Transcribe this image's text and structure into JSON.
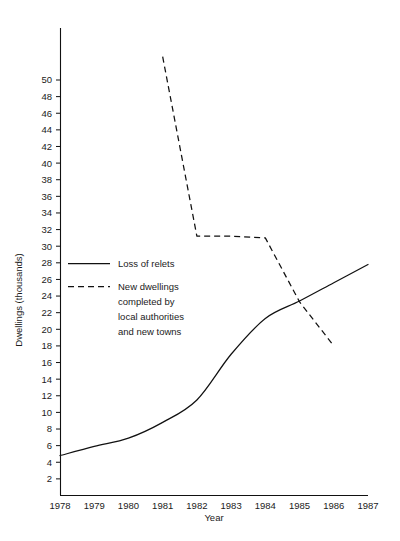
{
  "chart_data": {
    "type": "line",
    "title": "",
    "xlabel": "Year",
    "ylabel": "Dwellings (thousands)",
    "xlim": [
      1978,
      1987
    ],
    "ylim": [
      0,
      52
    ],
    "grid": false,
    "legend_position": "inside-left",
    "x": [
      1978,
      1979,
      1980,
      1981,
      1982,
      1983,
      1984,
      1985,
      1986,
      1987
    ],
    "xticklabels": [
      "1978",
      "1979",
      "1980",
      "1981",
      "1982",
      "1983",
      "1984",
      "1985",
      "1986",
      "1987"
    ],
    "yticks": [
      2,
      4,
      6,
      8,
      10,
      12,
      14,
      16,
      18,
      20,
      22,
      24,
      26,
      28,
      30,
      32,
      34,
      36,
      38,
      40,
      42,
      44,
      46,
      48,
      50
    ],
    "yticklabels": [
      "2",
      "4",
      "6",
      "8",
      "10",
      "12",
      "14",
      "16",
      "18",
      "20",
      "22",
      "24",
      "26",
      "28",
      "30",
      "32",
      "34",
      "36",
      "38",
      "40",
      "42",
      "44",
      "46",
      "48",
      "50"
    ],
    "series": [
      {
        "name": "Loss of relets",
        "style": "solid",
        "x": [
          1978,
          1979,
          1980,
          1981,
          1982,
          1983,
          1984,
          1985,
          1986,
          1987
        ],
        "values": [
          4.8,
          5.9,
          6.9,
          8.8,
          11.5,
          17.0,
          21.3,
          23.4,
          25.6,
          27.8
        ]
      },
      {
        "name": "New dwellings completed by local authorities and new towns",
        "style": "dashed",
        "x": [
          1981,
          1982,
          1983,
          1984,
          1985,
          1986
        ],
        "values": [
          52.8,
          31.2,
          31.2,
          31.0,
          23.3,
          18.0
        ]
      }
    ]
  },
  "legend": {
    "entries": [
      {
        "label": "Loss of relets",
        "style": "solid"
      },
      {
        "label": "New dwellings",
        "style": "dashed"
      },
      {
        "label": "completed by",
        "style": "none"
      },
      {
        "label": "local authorities",
        "style": "none"
      },
      {
        "label": "and new towns",
        "style": "none"
      }
    ]
  },
  "colors": {
    "ink": "#111111",
    "background": "#ffffff"
  }
}
